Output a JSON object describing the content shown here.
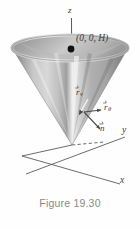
{
  "figure": {
    "caption": "Figure 19.30",
    "type": "3d-cone-parametric-surface-diagram"
  },
  "axes": {
    "z_label": "z",
    "y_label": "y",
    "x_label": "x"
  },
  "annotations": {
    "apex_point_label": "(0, 0, H)",
    "r_v_label": "r",
    "r_v_subscript": "v",
    "r_theta_label": "r",
    "r_theta_subscript": "θ",
    "n_label": "n"
  },
  "colors": {
    "background": "#fefefe",
    "cone_light": "#e2e2e2",
    "cone_mid": "#b4b4b4",
    "cone_dark": "#8e8e8e",
    "cone_darkest": "#6f6f6f",
    "rim_top": "#cfcfcf",
    "axis_line": "#5a5a5a",
    "label_text": "#3a3a3a",
    "caption_text": "#8a8a8a",
    "point_dot": "#111111"
  },
  "geometry": {
    "apex_x": 72,
    "apex_y": 145,
    "rim_center_x": 70,
    "rim_center_y": 48,
    "rim_rx": 58,
    "rim_ry": 13,
    "z_axis_top_y": 18,
    "point_dot_x": 71,
    "point_dot_y": 49
  }
}
